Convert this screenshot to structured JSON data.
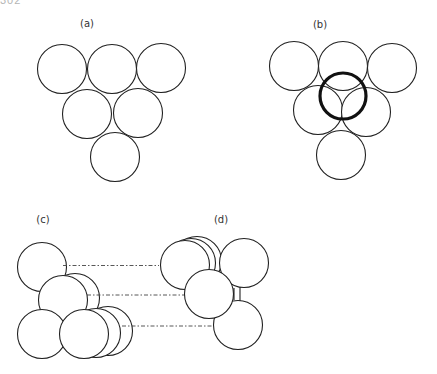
{
  "page_number": "302",
  "panels": {
    "a": {
      "label": "(a)",
      "label_pos": [
        87,
        18
      ]
    },
    "b": {
      "label": "(b)",
      "label_pos": [
        320,
        19
      ]
    },
    "c": {
      "label": "(c)",
      "label_pos": [
        43,
        214
      ]
    },
    "d": {
      "label": "(d)",
      "label_pos": [
        221,
        214
      ]
    }
  },
  "colors": {
    "stroke": "#222222",
    "bold_stroke": "#111111",
    "background": "#ffffff"
  }
}
